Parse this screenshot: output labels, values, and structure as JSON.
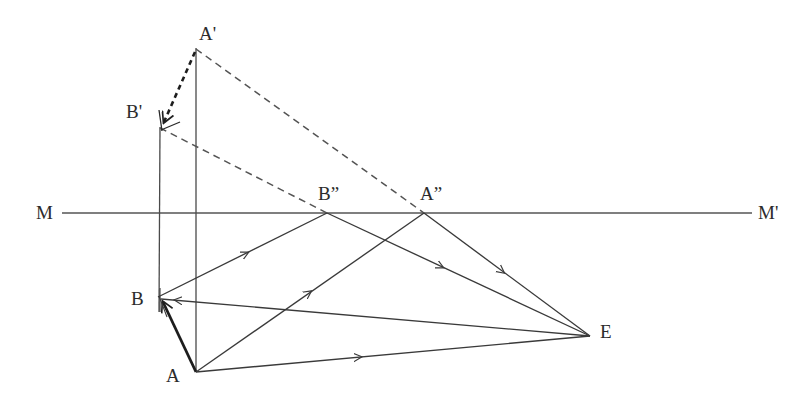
{
  "figure": {
    "type": "geometry-diagram",
    "title": "",
    "background_color": "#ffffff",
    "stroke_color": "#3a3a3a",
    "mirror_line_color": "#555555",
    "width": 805,
    "height": 418
  },
  "labels": {
    "a_prime": "A'",
    "b_prime": "B'",
    "b_double_prime": "B”",
    "a_double_prime": "A”",
    "m_left": "M",
    "m_right": "M'",
    "b": "B",
    "a": "A",
    "e": "E"
  },
  "points": {
    "A_prime": {
      "x": 196,
      "y": 48,
      "label": "A'",
      "label_x": 199,
      "label_y": 24
    },
    "B_prime": {
      "x": 160,
      "y": 127,
      "label": "B'",
      "label_x": 126,
      "label_y": 102
    },
    "B_double_prime": {
      "x": 327,
      "y": 213,
      "label": "B”",
      "label_x": 318,
      "label_y": 184
    },
    "A_double_prime": {
      "x": 424,
      "y": 213,
      "label": "A”",
      "label_x": 420,
      "label_y": 184
    },
    "M": {
      "x": 62,
      "y": 213,
      "label": "M",
      "label_x": 36,
      "label_y": 203
    },
    "M_prime": {
      "x": 752,
      "y": 213,
      "label": "M'",
      "label_x": 758,
      "label_y": 203
    },
    "B": {
      "x": 158,
      "y": 297,
      "label": "B",
      "label_x": 131,
      "label_y": 289
    },
    "A": {
      "x": 196,
      "y": 372,
      "label": "A",
      "label_x": 166,
      "label_y": 366
    },
    "E": {
      "x": 590,
      "y": 336,
      "label": "E",
      "label_x": 600,
      "label_y": 322
    }
  },
  "segments": [
    {
      "name": "mirror-line-M-Mprime",
      "from": "M",
      "to": "M_prime",
      "style": "solid",
      "weight": "thin",
      "arrow": "none"
    },
    {
      "name": "vertical-Bprime-B",
      "from": "B_prime",
      "to": "B",
      "style": "solid",
      "weight": "thin",
      "arrow": "none"
    },
    {
      "name": "vertical-Aprime-A",
      "from": "A_prime",
      "to": "A",
      "style": "solid",
      "weight": "thin",
      "arrow": "none"
    },
    {
      "name": "dashed-Aprime-Bprime",
      "from": "A_prime",
      "to": "B_prime",
      "style": "dashed",
      "weight": "thick",
      "arrow": "end"
    },
    {
      "name": "dashed-Aprime-Adoubleprime",
      "from": "A_prime",
      "to": "A_double_prime",
      "style": "dashed",
      "weight": "thin",
      "arrow": "none"
    },
    {
      "name": "dashed-Bprime-Bdoubleprime",
      "from": "B_prime",
      "to": "B_double_prime",
      "style": "dashed",
      "weight": "thin",
      "arrow": "none"
    },
    {
      "name": "solid-A-B",
      "from": "A",
      "to": "B",
      "style": "solid",
      "weight": "thick",
      "arrow": "end"
    },
    {
      "name": "solid-B-Bdoubleprime",
      "from": "B",
      "to": "B_double_prime",
      "style": "solid",
      "weight": "thin",
      "arrow": "mid"
    },
    {
      "name": "solid-A-Adoubleprime",
      "from": "A",
      "to": "A_double_prime",
      "style": "solid",
      "weight": "thin",
      "arrow": "mid"
    },
    {
      "name": "solid-Bdoubleprime-E",
      "from": "B_double_prime",
      "to": "E",
      "style": "solid",
      "weight": "thin",
      "arrow": "mid"
    },
    {
      "name": "solid-Adoubleprime-E",
      "from": "A_double_prime",
      "to": "E",
      "style": "solid",
      "weight": "thin",
      "arrow": "mid"
    },
    {
      "name": "solid-A-E",
      "from": "A",
      "to": "E",
      "style": "solid",
      "weight": "thin",
      "arrow": "mid"
    },
    {
      "name": "solid-E-B",
      "from": "E",
      "to": "B",
      "style": "solid",
      "weight": "thin",
      "arrow": "end"
    }
  ]
}
